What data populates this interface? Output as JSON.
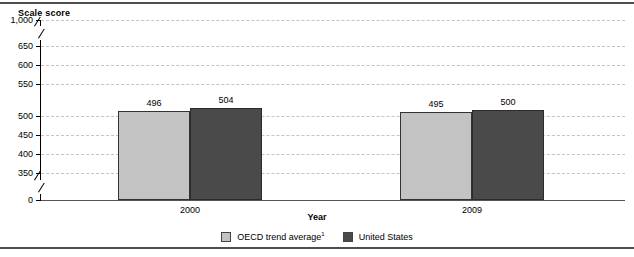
{
  "chart_data": {
    "type": "bar",
    "title": "",
    "ylabel": "Scale score",
    "xlabel": "Year",
    "categories": [
      "2000",
      "2009"
    ],
    "series": [
      {
        "name": "OECD trend average¹",
        "key": "oecd",
        "color": "#c3c3c3",
        "values": [
          496,
          495
        ]
      },
      {
        "name": "United States",
        "key": "us",
        "color": "#4a4a4a",
        "values": [
          504,
          500
        ]
      }
    ],
    "yticks": [
      "1,000",
      "650",
      "600",
      "550",
      "500",
      "450",
      "400",
      "350",
      "0"
    ],
    "ytick_values": [
      1000,
      650,
      600,
      550,
      500,
      450,
      400,
      350,
      0
    ],
    "ylim": [
      0,
      1000
    ],
    "axis_breaks": [
      {
        "between": "1,000 and 650"
      },
      {
        "between": "350 and 0"
      }
    ],
    "grid": "horizontal-dashed",
    "legend_position": "bottom-center"
  },
  "axis": {
    "y_title": "Scale score",
    "x_title": "Year"
  },
  "legend": {
    "items": [
      {
        "label": "OECD trend average",
        "superscript": "1",
        "color": "#c3c3c3"
      },
      {
        "label": "United States",
        "superscript": "",
        "color": "#4a4a4a"
      }
    ]
  }
}
